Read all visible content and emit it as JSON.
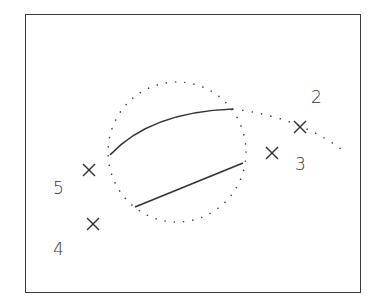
{
  "diagram": {
    "frame": {
      "x": 25,
      "y": 14,
      "width": 336,
      "height": 279,
      "color": "#3a3a3a"
    },
    "points": [
      {
        "id": "2",
        "label": "2",
        "cross": [
          300,
          127
        ],
        "label_pos": [
          311,
          89
        ]
      },
      {
        "id": "3",
        "label": "3",
        "cross": [
          272,
          153
        ],
        "label_pos": [
          295,
          156
        ]
      },
      {
        "id": "5",
        "label": "5",
        "cross": [
          89,
          170
        ],
        "label_pos": [
          53,
          180
        ]
      },
      {
        "id": "4",
        "label": "4",
        "cross": [
          93,
          224
        ],
        "label_pos": [
          53,
          241
        ]
      }
    ],
    "dotted_circle": {
      "cx": 177,
      "cy": 152,
      "rx": 69,
      "ry": 70
    },
    "solid_curves": [
      {
        "name": "upper-arc",
        "path": "M110,155 Q150,112 233,109"
      },
      {
        "name": "lower-line",
        "path": "M135,207 L243,163"
      }
    ],
    "dotted_tail": {
      "path": "M233,109 Q300,117 345,152"
    },
    "stroke_color": "#333333"
  }
}
